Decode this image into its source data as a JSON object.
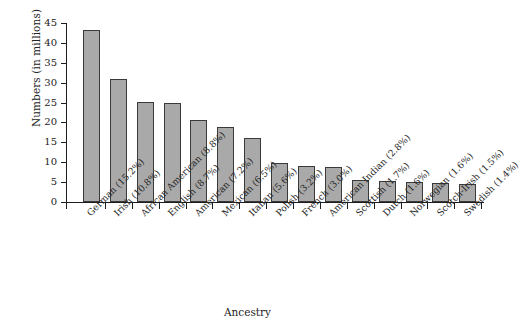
{
  "chart_data": {
    "type": "bar",
    "title": "",
    "xlabel": "Ancestry",
    "ylabel": "Numbers (in millions)",
    "ylim": [
      0,
      45
    ],
    "yticks": [
      0,
      5,
      10,
      15,
      20,
      25,
      30,
      35,
      40,
      45
    ],
    "grid": false,
    "legend": null,
    "bar_color": "#a9a9a9",
    "bar_edge_color": "#3a3a3a",
    "categories": [
      "German (15.2%)",
      "Irish (10.8%)",
      "African American (8.8%)",
      "English (8.7%)",
      "American (7.2%)",
      "Mexican (6.5%)",
      "Italian (5.6%)",
      "Polish (3.2%)",
      "French (3.0%)",
      "American Indian (2.8%)",
      "Scottish (1.7%)",
      "Dutch (1.6%)",
      "Norwegian (1.6%)",
      "Scotch-Irish (1.5%)",
      "Swedish (1.4%)"
    ],
    "values": [
      43.2,
      31.0,
      25.2,
      24.9,
      20.6,
      18.9,
      16.2,
      9.7,
      9.1,
      8.7,
      5.5,
      5.2,
      5.1,
      4.9,
      4.6
    ],
    "percentages": [
      15.2,
      10.8,
      8.8,
      8.7,
      7.2,
      6.5,
      5.6,
      3.2,
      3.0,
      2.8,
      1.7,
      1.6,
      1.6,
      1.5,
      1.4
    ]
  }
}
